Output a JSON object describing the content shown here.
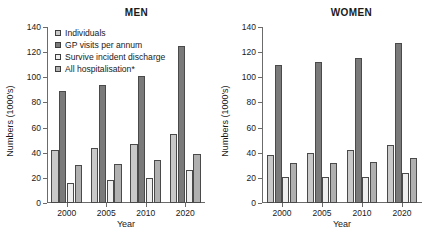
{
  "chart_data": {
    "type": "bar",
    "title": "",
    "xlabel": "Year",
    "ylabel": "Numbers (1000's)",
    "ylim": [
      0,
      140
    ],
    "yticks": [
      0,
      20,
      40,
      60,
      80,
      100,
      120,
      140
    ],
    "categories": [
      "2000",
      "2005",
      "2010",
      "2020"
    ],
    "grid": false,
    "legend_position": "top-left (MEN panel)",
    "legend": [
      "Individuals",
      "GP visits per annum",
      "Survive incident discharge",
      "All hospitalisation*"
    ],
    "series_colors": [
      "#c9c9c9",
      "#7a7a7a",
      "#eeeeee",
      "#b0b0b0"
    ],
    "panels": [
      {
        "title": "MEN",
        "series": [
          {
            "name": "Individuals",
            "values": [
              42,
              44,
              47,
              55
            ]
          },
          {
            "name": "GP visits per annum",
            "values": [
              89,
              94,
              101,
              125
            ]
          },
          {
            "name": "Survive incident discharge",
            "values": [
              16,
              18,
              20,
              26
            ]
          },
          {
            "name": "All hospitalisation*",
            "values": [
              30,
              31,
              34,
              39
            ]
          }
        ]
      },
      {
        "title": "WOMEN",
        "series": [
          {
            "name": "Individuals",
            "values": [
              38,
              40,
              42,
              46
            ]
          },
          {
            "name": "GP visits per annum",
            "values": [
              110,
              112,
              115,
              127
            ]
          },
          {
            "name": "Survive incident discharge",
            "values": [
              21,
              21,
              21,
              24
            ]
          },
          {
            "name": "All hospitalisation*",
            "values": [
              32,
              32,
              33,
              36
            ]
          }
        ]
      }
    ]
  }
}
